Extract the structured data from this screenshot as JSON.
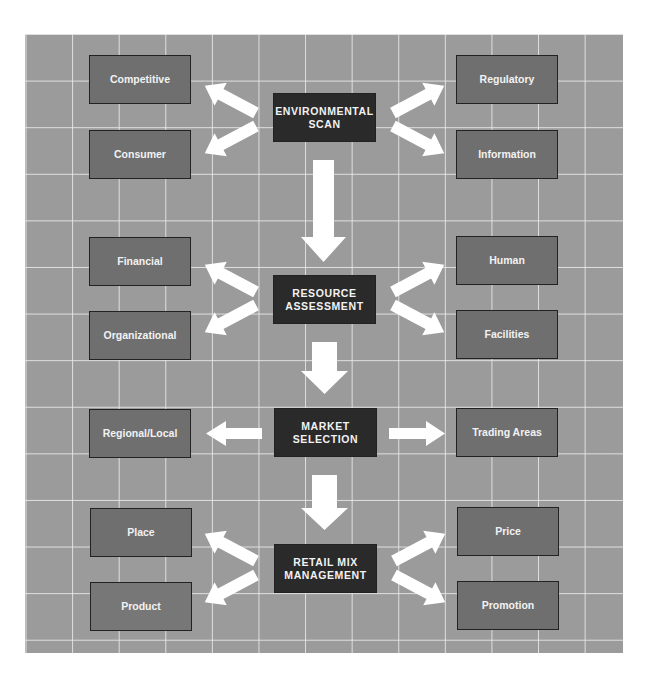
{
  "diagram": {
    "type": "flow",
    "colors": {
      "grid_background": "#9b9b9b",
      "grid_lines": "#e6e6e6",
      "side_box": "#6f6f6f",
      "center_box": "#2a2a2a",
      "arrow": "#ffffff",
      "text": "#f2f2f2"
    },
    "stages": [
      {
        "label_line1": "ENVIRONMENTAL",
        "label_line2": "SCAN",
        "left": [
          "Competitive",
          "Consumer"
        ],
        "right": [
          "Regulatory",
          "Information"
        ]
      },
      {
        "label_line1": "RESOURCE",
        "label_line2": "ASSESSMENT",
        "left": [
          "Financial",
          "Organizational"
        ],
        "right": [
          "Human",
          "Facilities"
        ]
      },
      {
        "label_line1": "MARKET",
        "label_line2": "SELECTION",
        "left": [
          "Regional/Local"
        ],
        "right": [
          "Trading Areas"
        ]
      },
      {
        "label_line1": "RETAIL MIX",
        "label_line2": "MANAGEMENT",
        "left": [
          "Place",
          "Product"
        ],
        "right": [
          "Price",
          "Promotion"
        ]
      }
    ]
  }
}
